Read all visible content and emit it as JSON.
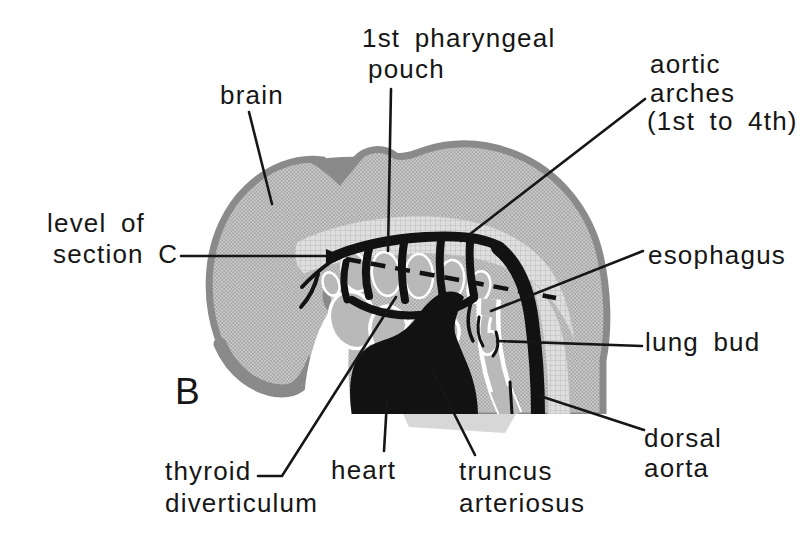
{
  "figure": {
    "type": "embryology-sagittal-diagram",
    "panel_label": "B",
    "colors": {
      "background": "#ffffff",
      "ink": "#121212",
      "body_stipple_gray": "#b7b7b7",
      "outline_gray": "#8a8a8a",
      "organ_gray": "#b9b9b9",
      "neural_band_gray": "#dedede"
    },
    "labels": {
      "brain": {
        "text": "brain"
      },
      "first_pharyngeal_pouch": {
        "line1": "1st pharyngeal",
        "line2": "pouch"
      },
      "aortic_arches": {
        "line1": "aortic",
        "line2": "arches",
        "line3": "(1st to 4th)"
      },
      "level_of_section_c": {
        "line1": "level of",
        "line2": "section C"
      },
      "esophagus": {
        "text": "esophagus"
      },
      "lung_bud": {
        "text": "lung bud"
      },
      "dorsal_aorta": {
        "line1": "dorsal",
        "line2": "aorta"
      },
      "truncus_arteriosus": {
        "line1": "truncus",
        "line2": "arteriosus"
      },
      "heart": {
        "text": "heart"
      },
      "thyroid_diverticulum": {
        "line1": "thyroid",
        "line2": "diverticulum"
      }
    }
  }
}
